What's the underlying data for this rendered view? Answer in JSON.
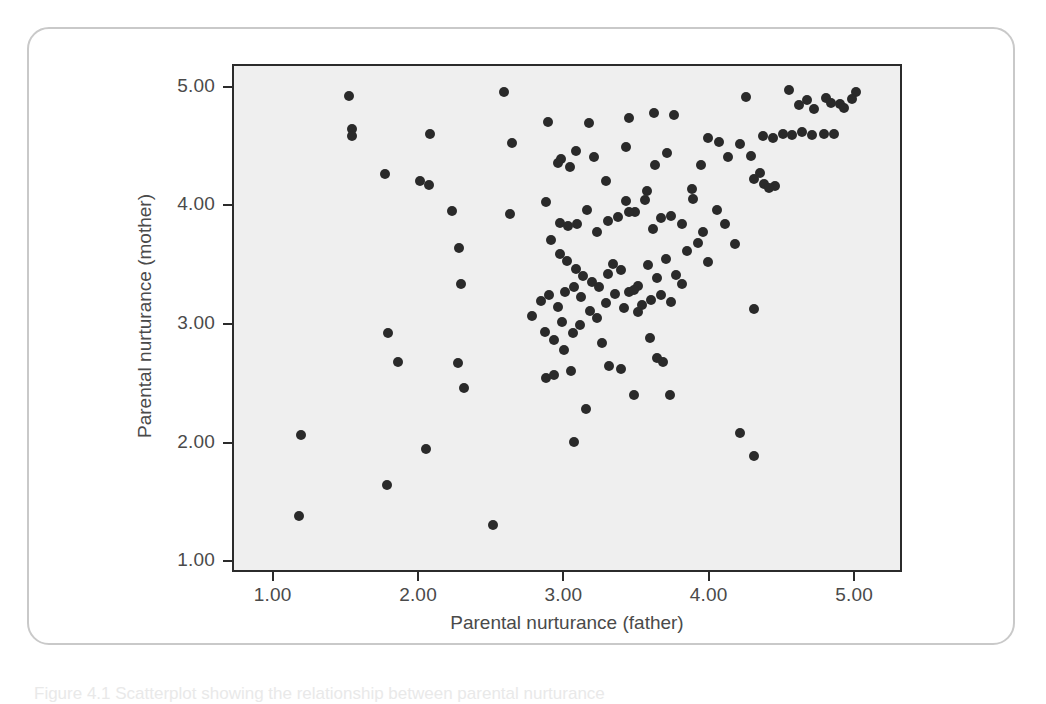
{
  "figure": {
    "caption": "Figure 4.1 Scatterplot showing the relationship between parental nurturance"
  },
  "chart_data": {
    "type": "scatter",
    "title": "",
    "xlabel": "Parental nurturance (father)",
    "ylabel": "Parental nurturance (mother)",
    "xlim": [
      0.72,
      5.33
    ],
    "ylim": [
      0.91,
      5.19
    ],
    "xticks": [
      "1.00",
      "2.00",
      "3.00",
      "4.00",
      "5.00"
    ],
    "xtick_values": [
      1.0,
      2.0,
      3.0,
      4.0,
      5.0
    ],
    "yticks": [
      "1.00",
      "2.00",
      "3.00",
      "4.00",
      "5.00"
    ],
    "ytick_values": [
      1.0,
      2.0,
      3.0,
      4.0,
      5.0
    ],
    "grid": false,
    "legend": null,
    "marker": {
      "shape": "circle",
      "color": "#2a2a2a",
      "size": 10
    },
    "plot_background": "#efefef",
    "n_points": 148,
    "points": [
      [
        1.51,
        4.94
      ],
      [
        1.53,
        4.66
      ],
      [
        1.53,
        4.6
      ],
      [
        2.07,
        4.62
      ],
      [
        2.58,
        4.97
      ],
      [
        2.88,
        4.72
      ],
      [
        3.16,
        4.71
      ],
      [
        3.44,
        4.75
      ],
      [
        3.61,
        4.79
      ],
      [
        3.75,
        4.78
      ],
      [
        4.24,
        4.93
      ],
      [
        4.54,
        4.99
      ],
      [
        4.61,
        4.86
      ],
      [
        4.66,
        4.9
      ],
      [
        4.71,
        4.83
      ],
      [
        4.79,
        4.92
      ],
      [
        4.83,
        4.88
      ],
      [
        4.89,
        4.87
      ],
      [
        5.0,
        4.97
      ],
      [
        4.97,
        4.91
      ],
      [
        4.92,
        4.84
      ],
      [
        1.76,
        4.28
      ],
      [
        2.0,
        4.22
      ],
      [
        2.06,
        4.19
      ],
      [
        2.63,
        4.54
      ],
      [
        2.97,
        4.41
      ],
      [
        3.03,
        4.34
      ],
      [
        3.07,
        4.47
      ],
      [
        3.28,
        4.22
      ],
      [
        3.42,
        4.51
      ],
      [
        3.56,
        4.14
      ],
      [
        3.62,
        4.36
      ],
      [
        3.7,
        4.46
      ],
      [
        3.98,
        4.58
      ],
      [
        4.06,
        4.55
      ],
      [
        4.2,
        4.53
      ],
      [
        4.28,
        4.43
      ],
      [
        4.36,
        4.6
      ],
      [
        4.43,
        4.58
      ],
      [
        4.5,
        4.62
      ],
      [
        4.56,
        4.61
      ],
      [
        4.63,
        4.63
      ],
      [
        4.7,
        4.61
      ],
      [
        4.78,
        4.62
      ],
      [
        4.85,
        4.62
      ],
      [
        4.3,
        4.24
      ],
      [
        4.37,
        4.2
      ],
      [
        4.44,
        4.18
      ],
      [
        2.22,
        3.97
      ],
      [
        2.27,
        3.66
      ],
      [
        2.62,
        3.94
      ],
      [
        2.87,
        4.04
      ],
      [
        2.96,
        3.87
      ],
      [
        3.02,
        3.84
      ],
      [
        3.08,
        3.86
      ],
      [
        3.15,
        3.98
      ],
      [
        3.22,
        3.79
      ],
      [
        3.29,
        3.88
      ],
      [
        3.36,
        3.92
      ],
      [
        3.42,
        4.05
      ],
      [
        3.48,
        3.96
      ],
      [
        3.55,
        4.06
      ],
      [
        3.6,
        3.82
      ],
      [
        3.66,
        3.91
      ],
      [
        3.73,
        3.93
      ],
      [
        3.8,
        3.86
      ],
      [
        3.88,
        4.07
      ],
      [
        3.95,
        3.79
      ],
      [
        4.04,
        3.98
      ],
      [
        4.1,
        3.86
      ],
      [
        4.17,
        3.69
      ],
      [
        2.9,
        3.72
      ],
      [
        2.96,
        3.61
      ],
      [
        3.01,
        3.55
      ],
      [
        3.07,
        3.48
      ],
      [
        3.12,
        3.42
      ],
      [
        3.18,
        3.37
      ],
      [
        3.23,
        3.33
      ],
      [
        3.29,
        3.44
      ],
      [
        3.33,
        3.52
      ],
      [
        3.38,
        3.47
      ],
      [
        3.44,
        3.29
      ],
      [
        3.5,
        3.34
      ],
      [
        3.57,
        3.51
      ],
      [
        3.63,
        3.4
      ],
      [
        3.69,
        3.56
      ],
      [
        3.76,
        3.43
      ],
      [
        3.84,
        3.63
      ],
      [
        3.91,
        3.7
      ],
      [
        3.98,
        3.54
      ],
      [
        2.28,
        3.35
      ],
      [
        2.77,
        3.08
      ],
      [
        2.83,
        3.21
      ],
      [
        2.89,
        3.26
      ],
      [
        2.95,
        3.16
      ],
      [
        3.0,
        3.29
      ],
      [
        3.06,
        3.33
      ],
      [
        3.11,
        3.24
      ],
      [
        3.17,
        3.13
      ],
      [
        3.22,
        3.07
      ],
      [
        3.28,
        3.19
      ],
      [
        3.34,
        3.27
      ],
      [
        3.4,
        3.15
      ],
      [
        3.47,
        3.3
      ],
      [
        3.53,
        3.18
      ],
      [
        3.59,
        3.22
      ],
      [
        3.66,
        3.26
      ],
      [
        3.73,
        3.2
      ],
      [
        3.8,
        3.35
      ],
      [
        4.3,
        3.14
      ],
      [
        1.78,
        2.94
      ],
      [
        2.86,
        2.95
      ],
      [
        2.92,
        2.88
      ],
      [
        2.99,
        2.8
      ],
      [
        3.05,
        2.94
      ],
      [
        3.1,
        3.01
      ],
      [
        3.25,
        2.86
      ],
      [
        3.58,
        2.9
      ],
      [
        3.67,
        2.7
      ],
      [
        1.85,
        2.7
      ],
      [
        2.26,
        2.69
      ],
      [
        2.87,
        2.56
      ],
      [
        2.92,
        2.59
      ],
      [
        3.04,
        2.62
      ],
      [
        3.3,
        2.66
      ],
      [
        3.38,
        2.64
      ],
      [
        3.63,
        2.73
      ],
      [
        3.72,
        2.42
      ],
      [
        2.3,
        2.48
      ],
      [
        3.14,
        2.3
      ],
      [
        3.47,
        2.42
      ],
      [
        1.18,
        2.08
      ],
      [
        2.04,
        1.96
      ],
      [
        3.06,
        2.02
      ],
      [
        4.2,
        2.1
      ],
      [
        4.3,
        1.9
      ],
      [
        1.77,
        1.66
      ],
      [
        1.17,
        1.4
      ],
      [
        2.5,
        1.32
      ],
      [
        4.34,
        4.29
      ],
      [
        4.4,
        4.16
      ],
      [
        3.2,
        4.42
      ],
      [
        2.95,
        4.37
      ],
      [
        3.87,
        4.15
      ],
      [
        3.5,
        3.12
      ],
      [
        2.98,
        3.03
      ],
      [
        3.44,
        3.96
      ],
      [
        4.12,
        4.42
      ],
      [
        3.93,
        4.36
      ]
    ]
  }
}
